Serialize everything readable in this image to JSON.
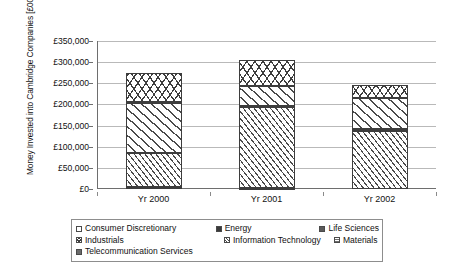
{
  "chart_data": {
    "type": "bar",
    "subtype": "stacked-bar",
    "title": "",
    "xlabel": "",
    "ylabel": "Money Invested into Cambridge Companies [£000s]",
    "ylabel_lines": [
      "Money Invested into Cambridge Companies",
      "[£000s]"
    ],
    "categories": [
      "Yr 2000",
      "Yr 2001",
      "Yr 2002"
    ],
    "ylim": [
      0,
      350000
    ],
    "y_tick_labels": [
      "£0",
      "£50,000",
      "£100,000",
      "£150,000",
      "£200,000",
      "£250,000",
      "£300,000",
      "£350,000"
    ],
    "y_tick_values": [
      0,
      50000,
      100000,
      150000,
      200000,
      250000,
      300000,
      350000
    ],
    "y_tick_step": 50000,
    "grid": true,
    "legend_position": "bottom",
    "currency_symbol": "£",
    "units": "£000s",
    "series": [
      {
        "name": "Consumer Discretionary",
        "pattern": "white-empty",
        "values": [
          0,
          0,
          0
        ]
      },
      {
        "name": "Energy",
        "pattern": "solid-dark",
        "values": [
          0,
          0,
          0
        ]
      },
      {
        "name": "Life Sciences",
        "pattern": "wide-diagonal-hatch",
        "values": [
          118000,
          52000,
          77000
        ]
      },
      {
        "name": "Industrials",
        "pattern": "cross-hatch",
        "values": [
          70000,
          60000,
          30000
        ]
      },
      {
        "name": "Information Technology",
        "pattern": "dense-diagonal-hatch",
        "values": [
          80000,
          193000,
          138000
        ]
      },
      {
        "name": "Materials",
        "pattern": "horizontal-stipple",
        "values": [
          0,
          0,
          0
        ]
      },
      {
        "name": "Telecommunication Services",
        "pattern": "solid-grey",
        "values": [
          5000,
          3000,
          0
        ]
      }
    ],
    "stack_order_bottom_to_top": [
      "Telecommunication Services",
      "Information Technology",
      "Life Sciences",
      "Energy",
      "Industrials"
    ],
    "bar_totals": [
      275000,
      305000,
      245000
    ],
    "stacks": [
      {
        "category": "Yr 2000",
        "total": 275000,
        "segments": [
          {
            "series": "Telecommunication Services",
            "from": 0,
            "to": 5000,
            "value": 5000
          },
          {
            "series": "Information Technology",
            "from": 5000,
            "to": 85000,
            "value": 80000
          },
          {
            "series": "Life Sciences",
            "from": 85000,
            "to": 203000,
            "value": 118000
          },
          {
            "series": "Energy",
            "from": 203000,
            "to": 206000,
            "value": 3000
          },
          {
            "series": "Industrials",
            "from": 206000,
            "to": 275000,
            "value": 69000
          }
        ]
      },
      {
        "category": "Yr 2001",
        "total": 305000,
        "segments": [
          {
            "series": "Telecommunication Services",
            "from": 0,
            "to": 2000,
            "value": 2000
          },
          {
            "series": "Information Technology",
            "from": 2000,
            "to": 193000,
            "value": 191000
          },
          {
            "series": "Energy",
            "from": 193000,
            "to": 197000,
            "value": 4000
          },
          {
            "series": "Life Sciences",
            "from": 197000,
            "to": 243000,
            "value": 46000
          },
          {
            "series": "Industrials",
            "from": 243000,
            "to": 305000,
            "value": 62000
          }
        ]
      },
      {
        "category": "Yr 2002",
        "total": 245000,
        "segments": [
          {
            "series": "Information Technology",
            "from": 0,
            "to": 138000,
            "value": 138000
          },
          {
            "series": "Energy",
            "from": 138000,
            "to": 142000,
            "value": 4000
          },
          {
            "series": "Life Sciences",
            "from": 142000,
            "to": 216000,
            "value": 74000
          },
          {
            "series": "Industrials",
            "from": 216000,
            "to": 245000,
            "value": 29000
          }
        ]
      }
    ]
  },
  "legend": {
    "rows": [
      [
        {
          "label": "Consumer Discretionary",
          "swatch": "consumer"
        },
        {
          "label": "Energy",
          "swatch": "energy"
        },
        {
          "label": "Life Sciences",
          "swatch": "life"
        }
      ],
      [
        {
          "label": "Industrials",
          "swatch": "industrials"
        },
        {
          "label": "Information Technology",
          "swatch": "it"
        },
        {
          "label": "Materials",
          "swatch": "materials"
        }
      ],
      [
        {
          "label": "Telecommunication Services",
          "swatch": "telecom"
        }
      ]
    ]
  }
}
